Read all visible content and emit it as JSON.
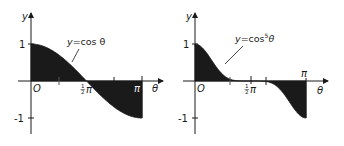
{
  "chart_data": [
    {
      "type": "area",
      "title": "",
      "curve_label": "y=cos θ",
      "function": "cos(theta)",
      "xlabel": "θ",
      "ylabel": "y",
      "origin_label": "O",
      "x_ticks": [
        {
          "value": 0,
          "label": ""
        },
        {
          "value": 0.7854,
          "label": ""
        },
        {
          "value": 1.5708,
          "label": "½π"
        },
        {
          "value": 2.3562,
          "label": ""
        },
        {
          "value": 3.1416,
          "label": "π"
        }
      ],
      "y_ticks": [
        {
          "value": 1,
          "label": "1"
        },
        {
          "value": -1,
          "label": "-1"
        }
      ],
      "xlim": [
        0,
        3.1416
      ],
      "ylim": [
        -1,
        1
      ],
      "x": [
        0,
        0.3927,
        0.7854,
        1.1781,
        1.5708,
        1.9635,
        2.3562,
        2.7489,
        3.1416
      ],
      "values": [
        1.0,
        0.924,
        0.707,
        0.383,
        0.0,
        -0.383,
        -0.707,
        -0.924,
        -1.0
      ],
      "fill": "shaded region between curve and θ-axis from 0 to π",
      "fill_color": "#1a1a1a"
    },
    {
      "type": "area",
      "title": "",
      "curve_label": "y=cos⁵θ",
      "function": "cos(theta)^5",
      "xlabel": "θ",
      "ylabel": "y",
      "origin_label": "O",
      "x_ticks": [
        {
          "value": 0,
          "label": ""
        },
        {
          "value": 0.7854,
          "label": ""
        },
        {
          "value": 1.5708,
          "label": "½π"
        },
        {
          "value": 2.3562,
          "label": ""
        },
        {
          "value": 3.1416,
          "label": "π"
        }
      ],
      "y_ticks": [
        {
          "value": 1,
          "label": "1"
        },
        {
          "value": -1,
          "label": "-1"
        }
      ],
      "xlim": [
        0,
        3.1416
      ],
      "ylim": [
        -1,
        1
      ],
      "x": [
        0,
        0.3927,
        0.7854,
        1.1781,
        1.5708,
        1.9635,
        2.3562,
        2.7489,
        3.1416
      ],
      "values": [
        1.0,
        0.673,
        0.177,
        0.008,
        0.0,
        -0.008,
        -0.177,
        -0.673,
        -1.0
      ],
      "fill": "shaded region between curve and θ-axis from 0 to π",
      "fill_color": "#1a1a1a"
    }
  ],
  "left": {
    "y_axis_label": "y",
    "x_axis_label": "θ",
    "origin": "O",
    "one": "1",
    "neg_one": "-1",
    "half": "1",
    "half_den": "2",
    "pi": "π",
    "curve_label_prefix": "y",
    "curve_label_rest": "=cos θ"
  },
  "right": {
    "y_axis_label": "y",
    "x_axis_label": "θ",
    "origin": "O",
    "one": "1",
    "neg_one": "-1",
    "half": "1",
    "half_den": "2",
    "pi": "π",
    "curve_label_prefix": "y",
    "curve_label_mid": "=cos",
    "curve_label_sup": "5",
    "curve_label_end": "θ"
  }
}
